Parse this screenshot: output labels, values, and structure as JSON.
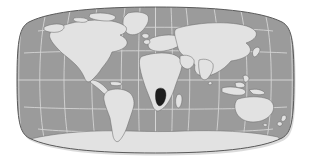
{
  "figure": {
    "name": "world-locator-map",
    "title": "World map locator",
    "projection": "Eckert III / Robinson pseudocylindrical",
    "width": 311,
    "height": 167,
    "background_color": "#ffffff"
  },
  "map": {
    "ocean_label": "Ocean",
    "land_label": "Land",
    "highlight_label": "Namibia",
    "border_label": "Map frame",
    "graticule_label": "Graticule",
    "frame": {
      "left": 17,
      "right": 294,
      "top": 7,
      "bottom": 153
    }
  },
  "colors": {
    "ocean": "#9b9b9b",
    "land": "#e2e2e2",
    "land_stroke": "#6e6e6e",
    "highlight": "#1e1e1e",
    "highlight_stroke": "#000000",
    "graticule": "#d8d8d8",
    "frame_stroke": "#5a5a5a",
    "background": "#ffffff",
    "shadow": "#bdbdbd"
  },
  "graticule": {
    "meridian_interval_deg": 30,
    "parallel_interval_deg": 30,
    "meridians": [
      -180,
      -150,
      -120,
      -90,
      -60,
      -30,
      0,
      30,
      60,
      90,
      120,
      150,
      180
    ],
    "parallels": [
      -60,
      -30,
      0,
      30,
      60
    ],
    "equator_label": "Equator",
    "prime_meridian_label": "Prime Meridian"
  },
  "continents": [
    {
      "name": "north-america",
      "label": "North America"
    },
    {
      "name": "greenland",
      "label": "Greenland"
    },
    {
      "name": "south-america",
      "label": "South America"
    },
    {
      "name": "africa",
      "label": "Africa"
    },
    {
      "name": "europe",
      "label": "Europe"
    },
    {
      "name": "asia",
      "label": "Asia"
    },
    {
      "name": "australia",
      "label": "Australia"
    },
    {
      "name": "antarctica",
      "label": "Antarctica"
    },
    {
      "name": "madagascar",
      "label": "Madagascar"
    },
    {
      "name": "new-zealand",
      "label": "New Zealand"
    },
    {
      "name": "japan",
      "label": "Japan"
    },
    {
      "name": "indonesia",
      "label": "Indonesia"
    },
    {
      "name": "british-isles",
      "label": "British Isles"
    },
    {
      "name": "iceland",
      "label": "Iceland"
    },
    {
      "name": "philippines",
      "label": "Philippines"
    },
    {
      "name": "caribbean",
      "label": "Caribbean"
    },
    {
      "name": "sri-lanka",
      "label": "Sri Lanka"
    }
  ],
  "highlight": {
    "country": "Namibia",
    "region": "Southern Africa",
    "fill": "#1e1e1e"
  }
}
